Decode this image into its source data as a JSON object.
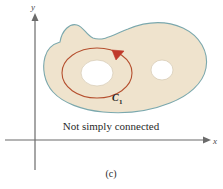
{
  "figure": {
    "panel_label": "(c)",
    "caption": "Not simply connected",
    "axes": {
      "y_label": "y",
      "x_label": "x",
      "axis_color": "#6b6b6b",
      "origin_x": 35,
      "origin_y": 140
    },
    "region": {
      "fill_color": "#efe3cd",
      "stroke_color": "#7ba8ad",
      "hole_fill": "#ffffff",
      "holes": [
        {
          "cx": 97,
          "cy": 73,
          "rx": 16,
          "ry": 13
        },
        {
          "cx": 162,
          "cy": 70,
          "rx": 11,
          "ry": 10
        }
      ]
    },
    "curve": {
      "label": "C",
      "label_subscript": "1",
      "color": "#b5502f",
      "orientation": "counterclockwise",
      "arrow_direction": "down-right"
    }
  }
}
